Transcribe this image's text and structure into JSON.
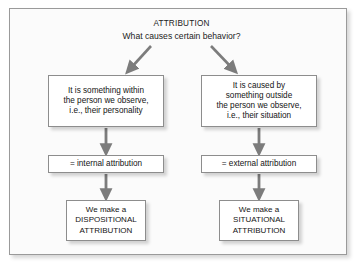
{
  "diagram": {
    "title": "ATTRIBUTION",
    "subtitle": "What causes certain behavior?",
    "branches": {
      "left": {
        "cause": "It is something within\nthe person we observe,\ni.e., their personality",
        "attribution": "= internal attribution",
        "result": "We make a\nDISPOSITIONAL\nATTRIBUTION"
      },
      "right": {
        "cause": "It is caused by\nsomething outside\nthe person we observe,\ni.e., their situation",
        "attribution": "= external attribution",
        "result": "We make a\nSITUATIONAL\nATTRIBUTION"
      }
    },
    "colors": {
      "frame_border": "#9a9a9a",
      "node_border": "#8d8d8d",
      "node_fill": "#ffffff",
      "panel_fill": "#fbfbfb",
      "arrow": "#7c7c7c",
      "text": "#141414"
    }
  }
}
